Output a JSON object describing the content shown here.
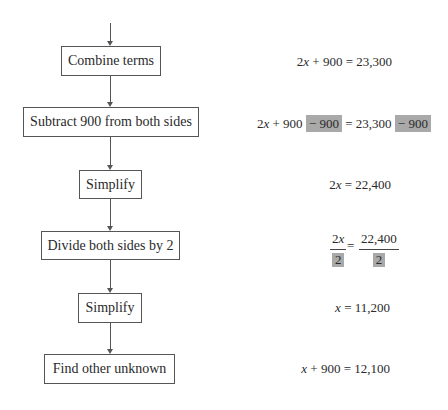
{
  "flowchart": {
    "steps": [
      {
        "label": "Combine terms"
      },
      {
        "label": "Subtract 900 from both sides"
      },
      {
        "label": "Simplify"
      },
      {
        "label": "Divide both sides by 2"
      },
      {
        "label": "Simplify"
      },
      {
        "label": "Find other unknown"
      }
    ]
  },
  "equations": {
    "eq1": {
      "lhs_coef": "2",
      "lhs_var": "x",
      "rest": " + 900 = 23,300"
    },
    "eq2": {
      "lhs_coef": "2",
      "lhs_var": "x",
      "plus": " + 900 ",
      "hl1": "− 900",
      "mid": " = 23,300 ",
      "hl2": "− 900"
    },
    "eq3": {
      "lhs_coef": "2",
      "lhs_var": "x",
      "rest": " = 22,400"
    },
    "eq4": {
      "left_num_coef": "2",
      "left_num_var": "x",
      "left_den": "2",
      "equals": "=",
      "right_num": "22,400",
      "right_den": "2"
    },
    "eq5": {
      "var": "x",
      "rest": " = 11,200"
    },
    "eq6": {
      "var": "x",
      "rest": " + 900 = 12,100"
    }
  },
  "colors": {
    "highlight": "#a9a9a9",
    "line": "#555555"
  }
}
